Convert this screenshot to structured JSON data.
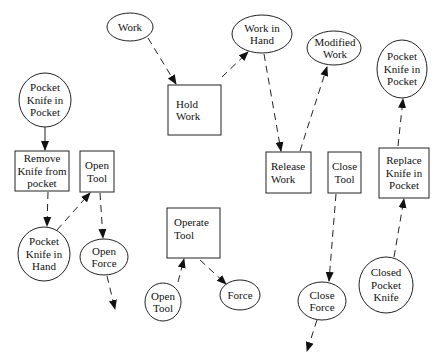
{
  "diagram": {
    "type": "process-flow",
    "nodes": {
      "work": {
        "shape": "ellipse",
        "label": "Work"
      },
      "work_in_hand": {
        "shape": "ellipse",
        "label": "Work in\nHand"
      },
      "modified_work": {
        "shape": "ellipse",
        "label": "Modified\nWork"
      },
      "pk_in_pocket_right": {
        "shape": "ellipse",
        "label": "Pocket\nKnife in\nPocket"
      },
      "pk_in_pocket_left": {
        "shape": "ellipse",
        "label": "Pocket\nKnife in\nPocket"
      },
      "hold_work": {
        "shape": "box",
        "label": "Hold\nWork"
      },
      "remove_knife": {
        "shape": "box",
        "label": "Remove\nKnife from\npocket"
      },
      "open_tool_box": {
        "shape": "box",
        "label": "Open\nTool"
      },
      "release_work": {
        "shape": "box",
        "label": "Release\nWork"
      },
      "close_tool_box": {
        "shape": "box",
        "label": "Close\nTool"
      },
      "replace_knife": {
        "shape": "box",
        "label": "Replace\nKnife in\nPocket"
      },
      "pk_in_hand": {
        "shape": "ellipse",
        "label": "Pocket\nKnife in\nHand"
      },
      "open_force": {
        "shape": "ellipse",
        "label": "Open\nForce"
      },
      "operate_tool": {
        "shape": "box",
        "label": "Operate\nTool"
      },
      "open_tool_ellipse": {
        "shape": "ellipse",
        "label": "Open\nTool"
      },
      "force": {
        "shape": "ellipse",
        "label": "Force"
      },
      "close_force": {
        "shape": "ellipse",
        "label": "Close\nForce"
      },
      "closed_pocket_knife": {
        "shape": "ellipse",
        "label": "Closed\nPocket\nKnife"
      }
    },
    "edges": [
      {
        "from": "work",
        "to": "hold_work",
        "style": "dashed"
      },
      {
        "from": "hold_work",
        "to": "work_in_hand",
        "style": "dashed"
      },
      {
        "from": "work_in_hand",
        "to": "release_work",
        "style": "dashed"
      },
      {
        "from": "release_work",
        "to": "modified_work",
        "style": "dashed"
      },
      {
        "from": "pk_in_pocket_left",
        "to": "remove_knife",
        "style": "solid"
      },
      {
        "from": "remove_knife",
        "to": "pk_in_hand",
        "style": "dashed"
      },
      {
        "from": "pk_in_hand",
        "to": "open_tool_box",
        "style": "dashed"
      },
      {
        "from": "open_tool_box",
        "to": "open_force",
        "style": "dashed"
      },
      {
        "from": "open_force",
        "to": "(out)",
        "style": "dashed"
      },
      {
        "from": "open_tool_ellipse",
        "to": "operate_tool",
        "style": "dashed"
      },
      {
        "from": "operate_tool",
        "to": "force",
        "style": "dashed"
      },
      {
        "from": "close_tool_box",
        "to": "close_force",
        "style": "dashed"
      },
      {
        "from": "close_force",
        "to": "(out)",
        "style": "dashed"
      },
      {
        "from": "closed_pocket_knife",
        "to": "replace_knife",
        "style": "dashed"
      },
      {
        "from": "replace_knife",
        "to": "pk_in_pocket_right",
        "style": "dashed"
      }
    ]
  }
}
